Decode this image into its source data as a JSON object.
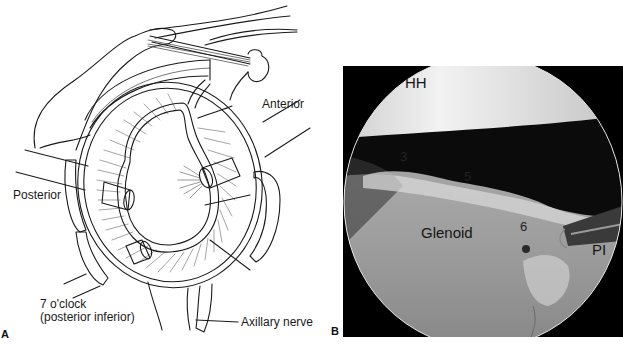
{
  "figure": {
    "panel_a": {
      "letter": "A",
      "labels": {
        "anterior": "Anterior",
        "posterior": "Posterior",
        "seven_oclock_line1": "7 o'clock",
        "seven_oclock_line2": "(posterior inferior)",
        "axillary_nerve": "Axillary nerve"
      }
    },
    "panel_b": {
      "letter": "B",
      "labels": {
        "humeral_head": "HH",
        "glenoid": "Glenoid",
        "posterior_inferior": "PI",
        "position_3": "3",
        "position_5": "5",
        "position_6": "6"
      }
    }
  }
}
